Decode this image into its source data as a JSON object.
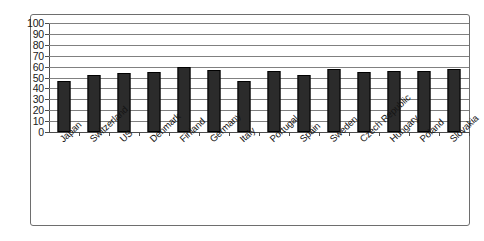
{
  "chart_data": {
    "type": "bar",
    "title": "",
    "subtitle": "",
    "xlabel": "",
    "ylabel": "",
    "ylim": [
      0,
      100
    ],
    "yticks": [
      0,
      10,
      20,
      30,
      40,
      50,
      60,
      70,
      80,
      90,
      100
    ],
    "grid": true,
    "legend": false,
    "legend_position": "none",
    "categories": [
      "Japan",
      "Switzerland",
      "US",
      "Denmark",
      "Finland",
      "Germany",
      "Italy",
      "Portugal",
      "Spain",
      "Sweden",
      "Czech Republic",
      "Hungary",
      "Poland",
      "Slovakia"
    ],
    "values": [
      47,
      52,
      54,
      55,
      60,
      57,
      47,
      56,
      52,
      58,
      55,
      56,
      56,
      58
    ],
    "series": [
      {
        "name": "",
        "values": [
          47,
          52,
          54,
          55,
          60,
          57,
          47,
          56,
          52,
          58,
          55,
          56,
          56,
          58
        ]
      }
    ],
    "colors": {
      "bar_fill": "#2b2b2b",
      "bar_border": "#000000",
      "gridline": "#808080",
      "axis": "#4d4d4d",
      "frame_border": "#6e6e6e",
      "background": "#ffffff",
      "text": "#141414"
    }
  }
}
